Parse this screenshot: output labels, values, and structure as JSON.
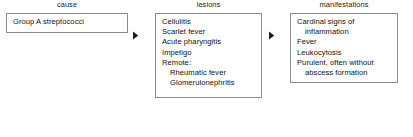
{
  "diagram": {
    "type": "flowchart",
    "orientation": "left-to-right",
    "columns": [
      {
        "label": "cause",
        "items": [
          {
            "text": "Group A streptococci",
            "indent": false
          }
        ]
      },
      {
        "label": "lesions",
        "items": [
          {
            "text": "Cellulitis",
            "indent": false
          },
          {
            "text": "Scarlet fever",
            "indent": false
          },
          {
            "text": "Acute pharyngitis",
            "indent": false
          },
          {
            "text": "Impetigo",
            "indent": false
          },
          {
            "text": "Remote:",
            "indent": false
          },
          {
            "text": "Rheumatic fever",
            "indent": true
          },
          {
            "text": "Glomerulonephritis",
            "indent": true
          }
        ]
      },
      {
        "label": "manifestations",
        "items": [
          {
            "text": "Cardinal signs of",
            "indent": false
          },
          {
            "text": "inflammation",
            "indent": true
          },
          {
            "text": "Fever",
            "indent": false
          },
          {
            "text": "Leukocytosis",
            "indent": false
          },
          {
            "text": "Purulent, often without",
            "indent": false
          },
          {
            "text": "abscess formation",
            "indent": true
          }
        ]
      }
    ],
    "connectors": [
      {
        "icon": "right-arrowhead-icon",
        "from": "cause",
        "to": "lesions"
      },
      {
        "icon": "right-arrowhead-icon",
        "from": "lesions",
        "to": "manifestations"
      }
    ]
  },
  "colors": {
    "background": "#ffffff",
    "box_border": "#8a8a8a",
    "text": "#111111",
    "label_text": "#222222",
    "arrow": "#1a1a1a"
  }
}
